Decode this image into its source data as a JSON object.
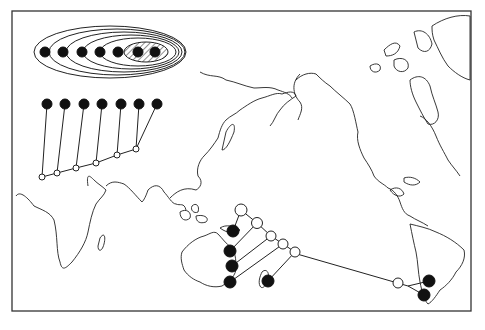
{
  "figure": {
    "type": "biogeographic cladogram on world map",
    "background": "#ffffff",
    "ink": "#111111",
    "frame": {
      "x": 12,
      "y": 11,
      "w": 459,
      "h": 300
    }
  },
  "nested_sets_diagram": {
    "description": "Nested ellipses enclosing taxa; innermost pair hatched",
    "taxa_count": 7,
    "ellipses": 6,
    "innermost_hatched": true
  },
  "cladogram_inset": {
    "terminal_taxa": 7,
    "internal_nodes": 6
  },
  "map_cladogram": {
    "region": "Australasia to South America",
    "terminals_australia": 4,
    "terminal_new_zealand": 1,
    "terminals_south_america": 2,
    "internal_nodes": 6
  },
  "continents": [
    "Africa",
    "Asia",
    "Australia",
    "North America",
    "South America",
    "Greenland"
  ]
}
